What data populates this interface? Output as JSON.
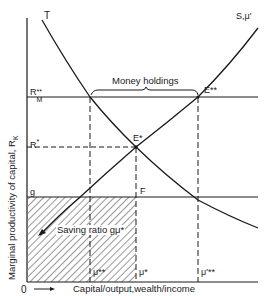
{
  "diagram": {
    "axes": {
      "y_label": "Marginal productivity of capital, R",
      "y_label_sub": "K",
      "x_label": "Capital/output,wealth/income",
      "origin": "0"
    },
    "curves": {
      "T": "T",
      "S": "S,μ'"
    },
    "y_ticks": {
      "r_m": "R",
      "r_m_sub": "M",
      "r_m_sup": "**",
      "r_star": "R",
      "r_star_sup": "*",
      "g": "g"
    },
    "x_ticks": {
      "mu_ss": "μ**",
      "mu_s": "μ*",
      "mu_prime_ss": "μ'**"
    },
    "points": {
      "e_star": "E*",
      "e_ss": "E**",
      "f": "F"
    },
    "annotations": {
      "money_holdings": "Money holdings",
      "saving_ratio": "Saving ratio gμ*"
    },
    "colors": {
      "ink": "#1a1a1a",
      "background": "#ffffff"
    }
  }
}
